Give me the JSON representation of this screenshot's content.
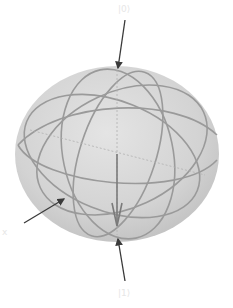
{
  "diagram": {
    "type": "bloch-sphere",
    "sphere": {
      "cx": 117,
      "cy": 154,
      "rx": 102,
      "ry": 88,
      "fill": "#cfcfcf",
      "edge": "#bdbdbd"
    },
    "grid_color": "#9a9a9a",
    "arrow_color": "#3a3a3a",
    "vector_color": "#7a7a7a",
    "labels": {
      "top": "|0⟩",
      "left": "x",
      "bottom": "|1⟩"
    }
  }
}
